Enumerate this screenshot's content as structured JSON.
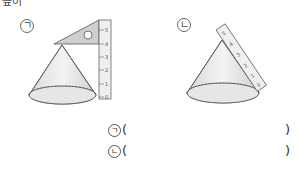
{
  "header": {
    "fragment": "높이"
  },
  "figures": [
    {
      "label": "ㄱ",
      "ruler_ticks": [
        "0",
        "1",
        "2",
        "3",
        "4",
        "5"
      ],
      "tool": "set-square-with-vertical-ruler"
    },
    {
      "label": "ㄴ",
      "ruler_ticks": [
        "0",
        "1",
        "2",
        "3",
        "4",
        "5"
      ],
      "tool": "slanted-ruler-along-side"
    }
  ],
  "answers": [
    {
      "label": "ㄱ",
      "open": "(",
      "close": ")",
      "value": ""
    },
    {
      "label": "ㄴ",
      "open": "(",
      "close": ")",
      "value": ""
    }
  ]
}
